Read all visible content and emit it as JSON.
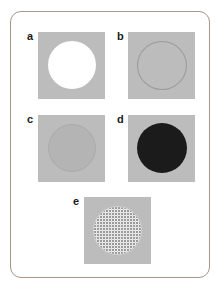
{
  "figure": {
    "frame": {
      "border_color": "#a9968a",
      "background_color": "#ffffff",
      "corner_radius_px": 11
    },
    "plate_color": "#bcbcbc",
    "panels": [
      {
        "id": "a",
        "label": "a",
        "plate_color": "#bcbcbc",
        "disc_style": "solid-white",
        "disc_color": "#ffffff",
        "description": "white filled circle on grey plate"
      },
      {
        "id": "b",
        "label": "b",
        "plate_color": "#bcbcbc",
        "disc_style": "outline",
        "disc_color": "#9b9b9b",
        "description": "thin circle outline, interior same grey as plate"
      },
      {
        "id": "c",
        "label": "c",
        "plate_color": "#bcbcbc",
        "disc_style": "solid-grey",
        "disc_color": "#b4b4b4",
        "description": "grey filled circle slightly different tone from plate"
      },
      {
        "id": "d",
        "label": "d",
        "plate_color": "#bcbcbc",
        "disc_style": "solid-black",
        "disc_color": "#1b1b1b",
        "description": "black filled circle on grey plate"
      },
      {
        "id": "e",
        "label": "e",
        "plate_color": "#bcbcbc",
        "disc_style": "stippled",
        "disc_color": "#fbfbfb",
        "description": "light stippled / dotted circle on grey plate"
      }
    ]
  }
}
